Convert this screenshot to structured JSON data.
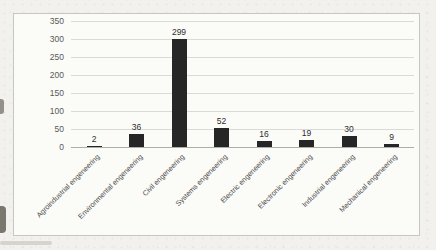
{
  "page": {
    "background_color": "#f2f1ed",
    "chart_background": "#fbfbf8",
    "chart_border_color": "#c6c6c2"
  },
  "chart_data": {
    "type": "bar",
    "title": "",
    "categories": [
      "Agroindustrial engeneering",
      "Environmental engeneering",
      "Civil engeneering",
      "Systems engeneering",
      "Electric engeneering",
      "Electronic engeneering",
      "Industrial engeneering",
      "Mechanical engeneering"
    ],
    "values": [
      2,
      36,
      299,
      52,
      16,
      19,
      30,
      9
    ],
    "yticks": [
      0,
      50,
      100,
      150,
      200,
      250,
      300,
      350
    ],
    "ylim": [
      0,
      350
    ],
    "xlabel": "",
    "ylabel": "",
    "legend": "none",
    "grid": true,
    "value_labels_visible": true,
    "x_label_rotation_deg": -45,
    "bar_color": "#262626",
    "gridline_color": "#dadad6",
    "axis_line_color": "#adadaa",
    "ytick_label_color": "#595959",
    "xtick_label_color": "#4a4a48",
    "value_label_color": "#2e2e2e"
  }
}
